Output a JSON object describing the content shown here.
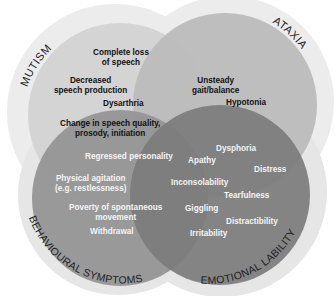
{
  "diagram": {
    "type": "venn",
    "sets": [
      {
        "name": "MUTISM",
        "color": "#d2d2d2",
        "ring_color": "#ededed"
      },
      {
        "name": "ATAXIA",
        "color": "#bdbdbd",
        "ring_color": "#ededed"
      },
      {
        "name": "BEHAVIOURAL SYMPTOMS",
        "color": "#909090",
        "ring_color": "#ededed"
      },
      {
        "name": "EMOTIONAL LABILITY",
        "color": "#7a7a7a",
        "ring_color": "#ededed"
      }
    ],
    "mutism_items": [
      "Complete loss of speech",
      "Decreased speech production",
      "Dysarthria",
      "Change in speech quality, prosody, initiation"
    ],
    "ataxia_items": [
      "Unsteady gait/balance",
      "Hypotonia"
    ],
    "behavioural_items": [
      "Regressed personality",
      "Physical agitation (e.g. restlessness)",
      "Poverty of spontaneous movement",
      "Withdrawal"
    ],
    "emotional_items": [
      "Dysphoria",
      "Apathy",
      "Distress",
      "Inconsolability",
      "Tearfulness",
      "Giggling",
      "Distractibility",
      "Irritability"
    ]
  },
  "labels": {
    "mutism": "MUTISM",
    "ataxia": "ATAXIA",
    "behavioural": "BEHAVIOURAL SYMPTOMS",
    "emotional": "EMOTIONAL LABILITY",
    "complete_loss_1": "Complete loss",
    "complete_loss_2": "of speech",
    "decreased_1": "Decreased",
    "decreased_2": "speech production",
    "dysarthria": "Dysarthria",
    "change_1": "Change in speech quality,",
    "change_2": "prosody, initiation",
    "unsteady_1": "Unsteady",
    "unsteady_2": "gait/balance",
    "hypotonia": "Hypotonia",
    "regressed": "Regressed personality",
    "physical_1": "Physical agitation",
    "physical_2": "(e.g. restlessness)",
    "poverty_1": "Poverty of spontaneous",
    "poverty_2": "movement",
    "withdrawal": "Withdrawal",
    "dysphoria": "Dysphoria",
    "apathy": "Apathy",
    "distress": "Distress",
    "inconsolability": "Inconsolability",
    "tearfulness": "Tearfulness",
    "giggling": "Giggling",
    "distractibility": "Distractibility",
    "irritability": "Irritability"
  }
}
